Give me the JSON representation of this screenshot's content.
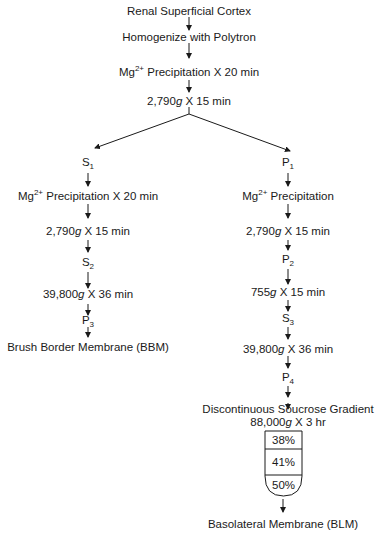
{
  "diagram": {
    "type": "flowchart",
    "trunk": [
      {
        "id": "n1",
        "text": "Renal Superficial Cortex"
      },
      {
        "id": "n2",
        "text": "Homogenize with Polytron"
      },
      {
        "id": "n3",
        "pre": "Mg",
        "sup": "2+",
        "post": " Precipitation X 20 min"
      },
      {
        "id": "n4",
        "num": "2,790",
        "g": "g",
        "post": " X 15 min"
      }
    ],
    "left_branch": [
      {
        "id": "l1",
        "base": "S",
        "sub": "1"
      },
      {
        "id": "l2",
        "pre": "Mg",
        "sup": "2+",
        "post": " Precipitation X 20 min"
      },
      {
        "id": "l3",
        "num": "2,790",
        "g": "g",
        "post": " X 15 min"
      },
      {
        "id": "l4",
        "base": "S",
        "sub": "2"
      },
      {
        "id": "l5",
        "num": "39,800",
        "g": "g",
        "post": " X 36 min"
      },
      {
        "id": "l6",
        "base": "P",
        "sub": "3"
      },
      {
        "id": "l7",
        "text": "Brush Border Membrane (BBM)"
      }
    ],
    "right_branch": [
      {
        "id": "r1",
        "base": "P",
        "sub": "1"
      },
      {
        "id": "r2",
        "pre": "Mg",
        "sup": "2+",
        "post": " Precipitation"
      },
      {
        "id": "r3",
        "num": "2,790",
        "g": "g",
        "post": " X 15 min"
      },
      {
        "id": "r4",
        "base": "P",
        "sub": "2"
      },
      {
        "id": "r5",
        "num": "755",
        "g": "g",
        "post": " X 15 min"
      },
      {
        "id": "r6",
        "base": "S",
        "sub": "3"
      },
      {
        "id": "r7",
        "num": "39,800",
        "g": "g",
        "post": " X 36 min"
      },
      {
        "id": "r8",
        "base": "P",
        "sub": "4"
      },
      {
        "id": "r9",
        "text": "Discontinuous Soucrose Gradient"
      },
      {
        "id": "r10",
        "num": "88,000",
        "g": "g",
        "post": " X 3 hr"
      },
      {
        "id": "r11",
        "text": "Basolateral Membrane (BLM)"
      }
    ],
    "gradient_tube": {
      "layers": [
        "38%",
        "41%",
        "50%"
      ]
    },
    "colors": {
      "line": "#1a1a1a",
      "background": "#ffffff"
    }
  }
}
